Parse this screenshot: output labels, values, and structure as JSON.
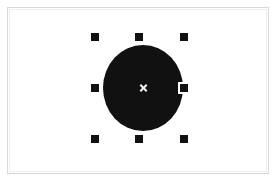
{
  "app": {
    "name": "Vector Drawing Canvas",
    "background_color": "#ffffff"
  },
  "canvas": {
    "frame_border_color": "#d8d8d8",
    "surface_color": "#ffffff"
  },
  "selection": {
    "object_type": "ellipse",
    "fill_color": "#111111",
    "handle_color": "#111111",
    "handle_outline_color": "#ffffff",
    "center_marker_color": "#f2f2f2",
    "center_marker_icon": "cross-marker-icon",
    "handles": [
      {
        "id": "nw",
        "name": "resize-handle-top-left",
        "cursor": "nwse-resize"
      },
      {
        "id": "n",
        "name": "resize-handle-top-center",
        "cursor": "ns-resize"
      },
      {
        "id": "ne",
        "name": "resize-handle-top-right",
        "cursor": "nesw-resize"
      },
      {
        "id": "w",
        "name": "resize-handle-middle-left",
        "cursor": "ew-resize"
      },
      {
        "id": "e",
        "name": "resize-handle-middle-right",
        "cursor": "ew-resize"
      },
      {
        "id": "sw",
        "name": "resize-handle-bottom-left",
        "cursor": "nesw-resize"
      },
      {
        "id": "s",
        "name": "resize-handle-bottom-center",
        "cursor": "ns-resize"
      },
      {
        "id": "se",
        "name": "resize-handle-bottom-right",
        "cursor": "nwse-resize"
      }
    ]
  }
}
